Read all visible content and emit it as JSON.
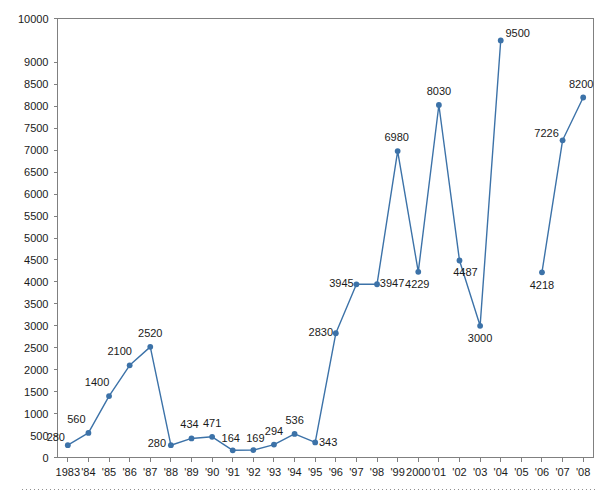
{
  "chart_data": {
    "type": "line",
    "title": "",
    "subtitle": "",
    "xlabel": "",
    "ylabel": "",
    "legend": [],
    "legend_position": "none",
    "grid": false,
    "ylim": [
      0,
      10000
    ],
    "ytick_step": 500,
    "ytick_labels": [
      "0",
      "500",
      "1000",
      "1500",
      "2000",
      "2500",
      "3000",
      "3500",
      "4000",
      "4500",
      "5000",
      "5500",
      "6000",
      "6500",
      "7000",
      "7500",
      "8000",
      "8500",
      "9000",
      "10000"
    ],
    "ytick_values": [
      0,
      500,
      1000,
      1500,
      2000,
      2500,
      3000,
      3500,
      4000,
      4500,
      5000,
      5500,
      6000,
      6500,
      7000,
      7500,
      8000,
      8500,
      9000,
      10000
    ],
    "categories": [
      "1983",
      "'84",
      "'85",
      "'86",
      "'87",
      "'88",
      "'89",
      "'90",
      "'91",
      "'92",
      "'93",
      "'94",
      "'95",
      "'96",
      "'97",
      "'98",
      "'99",
      "2000",
      "'01",
      "'02",
      "'03",
      "'04",
      "'05",
      "'06",
      "'07",
      "'08"
    ],
    "values": [
      280,
      560,
      1400,
      2100,
      2520,
      280,
      434,
      471,
      164,
      169,
      294,
      536,
      343,
      2830,
      3945,
      3947,
      6980,
      4229,
      8030,
      4487,
      3000,
      9500,
      null,
      4218,
      7226,
      8200
    ],
    "point_labels": [
      "280",
      "560",
      "1400",
      "2100",
      "2520",
      "280",
      "434",
      "471",
      "164",
      "169",
      "294",
      "536",
      "343",
      "2830",
      "3945",
      "3947",
      "6980",
      "4229",
      "8030",
      "4487",
      "3000",
      "9500",
      "",
      "4218",
      "7226",
      "8200"
    ],
    "series": [
      {
        "name": "series-1",
        "values": [
          280,
          560,
          1400,
          2100,
          2520,
          280,
          434,
          471,
          164,
          169,
          294,
          536,
          343,
          2830,
          3945,
          3947,
          6980,
          4229,
          8030,
          4487,
          3000,
          9500,
          null,
          4218,
          7226,
          8200
        ]
      }
    ],
    "colors": {
      "line": "#3c72a8",
      "marker": "#3c72a8",
      "axis": "#808080",
      "text": "#1a1a1a",
      "background": "#ffffff",
      "rule": "#909090"
    }
  },
  "label_offsets": {
    "1983": {
      "dx": -12,
      "dy": -4
    },
    "'84": {
      "dx": -12,
      "dy": -10
    },
    "'85": {
      "dx": -12,
      "dy": -10
    },
    "'86": {
      "dx": -10,
      "dy": -10
    },
    "'87": {
      "dx": 0,
      "dy": -10
    },
    "'88": {
      "dx": -14,
      "dy": 2
    },
    "'89": {
      "dx": -2,
      "dy": -10
    },
    "'90": {
      "dx": 0,
      "dy": -10
    },
    "'91": {
      "dx": -2,
      "dy": -8
    },
    "'92": {
      "dx": 2,
      "dy": -8
    },
    "'93": {
      "dx": 0,
      "dy": -10
    },
    "'94": {
      "dx": 0,
      "dy": -10
    },
    "'95": {
      "dx": 13,
      "dy": 4
    },
    "'96": {
      "dx": -15,
      "dy": 3
    },
    "'97": {
      "dx": -15,
      "dy": 3
    },
    "'98": {
      "dx": 15,
      "dy": 3
    },
    "'99": {
      "dx": -1,
      "dy": -10
    },
    "2000": {
      "dx": -1,
      "dy": 16
    },
    "'01": {
      "dx": 0,
      "dy": -10
    },
    "'02": {
      "dx": 6,
      "dy": 15
    },
    "'03": {
      "dx": 0,
      "dy": 16
    },
    "'04": {
      "dx": 17,
      "dy": -3
    },
    "'05": {
      "dx": 0,
      "dy": 0
    },
    "'06": {
      "dx": 0,
      "dy": 17
    },
    "'07": {
      "dx": -16,
      "dy": -3
    },
    "'08": {
      "dx": -2,
      "dy": -10
    }
  }
}
